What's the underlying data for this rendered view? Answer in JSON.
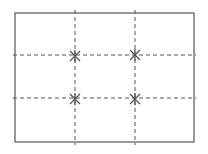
{
  "diagram": {
    "type": "rule-of-thirds-grid",
    "colors": {
      "background": "#ffffff",
      "frame": "#555555",
      "grid": "#555555",
      "marker": "#555555"
    },
    "frame": {
      "x1": 15,
      "y1": 13,
      "x2": 194,
      "y2": 142
    },
    "vertical_lines": [
      {
        "x": 75,
        "y1": 10,
        "y2": 145
      },
      {
        "x": 135,
        "y1": 10,
        "y2": 145
      }
    ],
    "horizontal_lines": [
      {
        "y": 55,
        "x1": 13,
        "x2": 196
      },
      {
        "y": 98,
        "x1": 13,
        "x2": 196
      }
    ],
    "intersection_markers": [
      {
        "x": 75,
        "y": 56,
        "icon": "asterisk-icon"
      },
      {
        "x": 135,
        "y": 55,
        "icon": "asterisk-icon"
      },
      {
        "x": 75,
        "y": 99,
        "icon": "asterisk-icon"
      },
      {
        "x": 135,
        "y": 99,
        "icon": "asterisk-icon"
      }
    ]
  }
}
